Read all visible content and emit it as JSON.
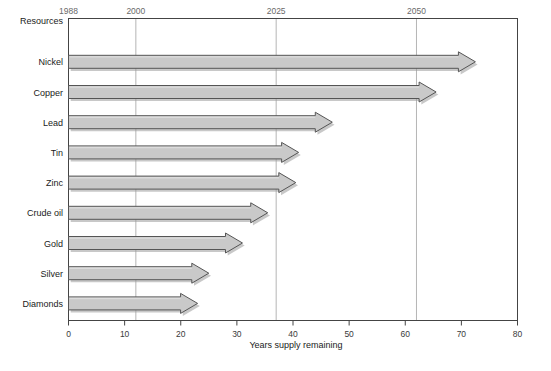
{
  "chart_data": {
    "type": "bar",
    "orientation": "horizontal",
    "title": "",
    "xlabel": "Years supply remaining",
    "ylabel": "Resources",
    "categories": [
      "Nickel",
      "Copper",
      "Lead",
      "Tin",
      "Zinc",
      "Crude oil",
      "Gold",
      "Silver",
      "Diamonds"
    ],
    "values": [
      72.5,
      65.5,
      47,
      41,
      40.5,
      35.5,
      31,
      25,
      23
    ],
    "xlim": [
      0,
      80
    ],
    "xticks": [
      0,
      10,
      20,
      30,
      40,
      50,
      60,
      70,
      80
    ],
    "xticklabels": [
      "0",
      "10",
      "20",
      "30",
      "40",
      "50",
      "60",
      "70",
      "80"
    ],
    "top_axis": {
      "label": "",
      "ticks": [
        0,
        12,
        37,
        62
      ],
      "ticklabels": [
        "1988",
        "2000",
        "2025",
        "2050"
      ],
      "gridlines": [
        12,
        37,
        62
      ]
    },
    "grid": "vertical-only",
    "legend": "none",
    "bar_style": "arrow",
    "colors": {
      "bar_fill": "#c9c9c9",
      "bar_edge": "#555555",
      "shadow": "#9a9a9a",
      "grid": "#b5b5b5",
      "axis": "#444444",
      "background": "#ffffff"
    }
  },
  "labels": {
    "category_header": "Resources",
    "x_axis_title": "Years supply remaining"
  }
}
